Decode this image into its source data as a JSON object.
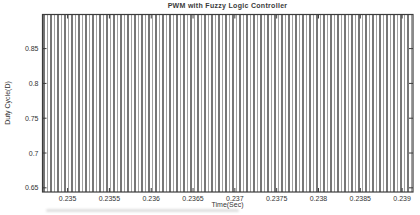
{
  "figure": {
    "title": "PWM with Fuzzy Logic Controller",
    "xlabel": "Time(Sec)",
    "ylabel": "Duty Cycle(D)"
  },
  "chart_data": {
    "type": "line",
    "title": "PWM with Fuzzy Logic Controller",
    "xlabel": "Time(Sec)",
    "ylabel": "Duty Cycle(D)",
    "xlim": [
      0.2347,
      0.23913
    ],
    "ylim": [
      0.644,
      0.899
    ],
    "x_ticks": [
      0.235,
      0.2355,
      0.236,
      0.2365,
      0.237,
      0.2375,
      0.238,
      0.2385,
      0.239
    ],
    "x_tick_labels": [
      "0.235",
      "0.2355",
      "0.236",
      "0.2365",
      "0.237",
      "0.2375",
      "0.238",
      "0.2385",
      "0.239"
    ],
    "y_ticks": [
      0.65,
      0.7,
      0.75,
      0.8,
      0.85
    ],
    "y_tick_labels": [
      "0.65",
      "0.7",
      "0.75",
      "0.8",
      "0.85"
    ],
    "grid": false,
    "legend": null,
    "box": true,
    "ticks_inward_all_sides": true,
    "signal": {
      "kind": "pwm-square-wave",
      "description": "High-frequency PWM output; switching edges alias into dense vertical lines spanning the full plot height between the axis limits",
      "x_start": 0.2347,
      "x_end": 0.23913,
      "num_edges": 106,
      "y_low": 0.644,
      "y_high": 0.899
    }
  },
  "colors": {
    "background": "#ffffff",
    "axis": "#3c3c3c",
    "text": "#333333",
    "stripe_dark": "#2e2e2e",
    "stripe_light": "#969696"
  }
}
